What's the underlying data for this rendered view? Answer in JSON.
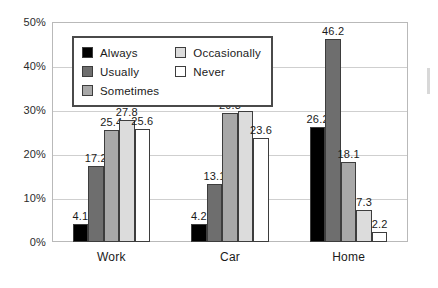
{
  "chart_data": {
    "type": "bar",
    "title": "",
    "subtitle": "",
    "xlabel": "",
    "ylabel": "",
    "categories": [
      "Work",
      "Car",
      "Home"
    ],
    "series": [
      {
        "name": "Always",
        "color": "#000000",
        "values": [
          4.1,
          4.2,
          26.2
        ]
      },
      {
        "name": "Usually",
        "color": "#6e6e6e",
        "values": [
          17.2,
          13.1,
          46.2
        ]
      },
      {
        "name": "Sometimes",
        "color": "#a8a8a8",
        "values": [
          25.4,
          29.3,
          18.1
        ]
      },
      {
        "name": "Occasionally",
        "color": "#dcdcdc",
        "values": [
          27.8,
          29.7,
          7.3
        ]
      },
      {
        "name": "Never",
        "color": "#ffffff",
        "values": [
          25.6,
          23.6,
          2.2
        ]
      }
    ],
    "ylim": [
      0,
      50
    ],
    "yticks": [
      0,
      10,
      20,
      30,
      40,
      50
    ],
    "ytick_labels": [
      "0%",
      "10%",
      "20%",
      "30%",
      "40%",
      "50%"
    ],
    "grid": true,
    "grid_axis": "y",
    "legend_position": "upper-left-inside",
    "data_labels": true,
    "bar_border_color": "#3d3d3d",
    "plot_border_color": "#b9b9b9",
    "gridline_color": "#cfcfcf"
  }
}
